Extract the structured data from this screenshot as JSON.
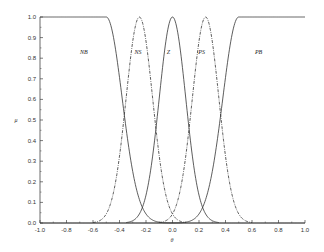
{
  "chart_data": {
    "type": "line",
    "title": "",
    "xlabel": "θ",
    "ylabel": "μ",
    "xlim": [
      -1.0,
      1.0
    ],
    "ylim": [
      0.0,
      1.0
    ],
    "grid": false,
    "legend": "inline labels above curves",
    "xticks": [
      "-1.0",
      "-0.8",
      "-0.6",
      "-0.4",
      "-0.2",
      "0.0",
      "0.2",
      "0.4",
      "0.6",
      "0.8",
      "1.0"
    ],
    "yticks": [
      "0.0",
      "0.1",
      "0.2",
      "0.3",
      "0.4",
      "0.5",
      "0.6",
      "0.7",
      "0.8",
      "0.9",
      "1.0"
    ],
    "series": [
      {
        "name": "NB",
        "style": "solid",
        "shape": "left-shoulder",
        "plateau_until": -0.5,
        "center": -0.5,
        "sigma": 0.12,
        "label_at": [
          -0.67,
          0.82
        ]
      },
      {
        "name": "NS",
        "style": "dashdot",
        "shape": "gaussian",
        "center": -0.25,
        "sigma": 0.1,
        "label_at": [
          -0.26,
          0.82
        ]
      },
      {
        "name": "Z",
        "style": "solid",
        "shape": "gaussian",
        "center": 0.0,
        "sigma": 0.1,
        "label_at": [
          -0.03,
          0.82
        ]
      },
      {
        "name": "PS",
        "style": "dashdot",
        "shape": "gaussian",
        "center": 0.25,
        "sigma": 0.1,
        "label_at": [
          0.22,
          0.82
        ]
      },
      {
        "name": "PB",
        "style": "solid",
        "shape": "right-shoulder",
        "plateau_from": 0.5,
        "center": 0.5,
        "sigma": 0.12,
        "label_at": [
          0.65,
          0.82
        ]
      }
    ],
    "sample_values": {
      "x": [
        -1.0,
        -0.6,
        -0.5,
        -0.4,
        -0.37,
        -0.25,
        -0.125,
        0.0,
        0.125,
        0.25,
        0.37,
        0.4,
        0.5,
        0.6,
        1.0
      ],
      "NB": [
        1.0,
        1.0,
        1.0,
        0.71,
        0.56,
        0.11,
        0.0,
        0.0,
        0.0,
        0.0,
        0.0,
        0.0,
        0.0,
        0.0,
        0.0
      ],
      "NS": [
        0.0,
        0.0,
        0.04,
        0.32,
        0.49,
        1.0,
        0.46,
        0.04,
        0.0,
        0.0,
        0.0,
        0.0,
        0.0,
        0.0,
        0.0
      ],
      "Z": [
        0.0,
        0.0,
        0.0,
        0.0,
        0.0,
        0.04,
        0.46,
        1.0,
        0.46,
        0.04,
        0.0,
        0.0,
        0.0,
        0.0,
        0.0
      ],
      "PS": [
        0.0,
        0.0,
        0.0,
        0.0,
        0.0,
        0.0,
        0.0,
        0.04,
        0.46,
        1.0,
        0.49,
        0.32,
        0.04,
        0.0,
        0.0
      ],
      "PB": [
        0.0,
        0.0,
        0.0,
        0.0,
        0.0,
        0.0,
        0.0,
        0.0,
        0.0,
        0.11,
        0.56,
        0.71,
        1.0,
        1.0,
        1.0
      ]
    }
  }
}
